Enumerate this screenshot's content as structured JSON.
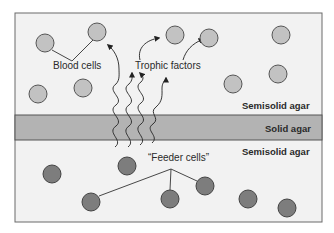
{
  "diagram": {
    "labels": {
      "blood_cells": "Blood cells",
      "trophic_factors": "Trophic factors",
      "feeder_cells": "“Feeder cells”",
      "semisolid_top": "Semisolid agar",
      "solid": "Solid agar",
      "semisolid_bottom": "Semisolid agar"
    },
    "colors": {
      "background": "#f2f2f2",
      "frame": "#6a6a6a",
      "solid_band": "#b3b3b3",
      "blood_cell_fill": "#c2c2c2",
      "feeder_cell_fill": "#7d7d7d",
      "cell_stroke": "#555555"
    },
    "layers": [
      {
        "name": "Semisolid agar",
        "position": "top",
        "contains": "Blood cells"
      },
      {
        "name": "Solid agar",
        "position": "middle"
      },
      {
        "name": "Semisolid agar",
        "position": "bottom",
        "contains": "Feeder cells"
      }
    ]
  }
}
